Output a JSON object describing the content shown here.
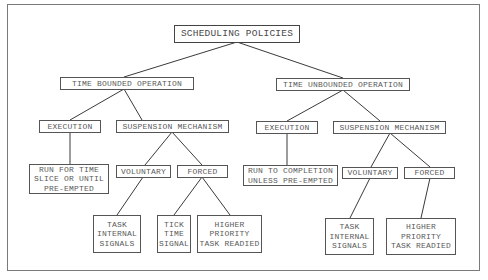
{
  "diagram": {
    "title": "SCHEDULING POLICIES",
    "nodes": {
      "root": {
        "label": "SCHEDULING POLICIES"
      },
      "tb": {
        "label": "TIME BOUNDED OPERATION"
      },
      "tu": {
        "label": "TIME UNBOUNDED OPERATION"
      },
      "tb_exec": {
        "label": "EXECUTION"
      },
      "tb_susp": {
        "label": "SUSPENSION MECHANISM"
      },
      "tu_exec": {
        "label": "EXECUTION"
      },
      "tu_susp": {
        "label": "SUSPENSION MECHANISM"
      },
      "tb_exec_desc": {
        "lines": [
          "RUN FOR TIME",
          "SLICE OR UNTIL",
          "PRE-EMPTED"
        ]
      },
      "tb_vol": {
        "label": "VOLUNTARY"
      },
      "tb_forced": {
        "label": "FORCED"
      },
      "tu_exec_desc": {
        "lines": [
          "RUN TO COMPLETION",
          "UNLESS PRE-EMPTED"
        ]
      },
      "tu_vol": {
        "label": "VOLUNTARY"
      },
      "tu_forced": {
        "label": "FORCED"
      },
      "tb_vol_task": {
        "lines": [
          "TASK",
          "INTERNAL",
          "SIGNALS"
        ]
      },
      "tb_forced_tick": {
        "lines": [
          "TICK",
          "TIME",
          "SIGNAL"
        ]
      },
      "tb_forced_higher": {
        "lines": [
          "HIGHER",
          "PRIORITY",
          "TASK READIED"
        ]
      },
      "tu_vol_task": {
        "lines": [
          "TASK",
          "INTERNAL",
          "SIGNALS"
        ]
      },
      "tu_forced_higher": {
        "lines": [
          "HIGHER",
          "PRIORITY",
          "TASK READIED"
        ]
      }
    },
    "edges": [
      [
        "root",
        "tb"
      ],
      [
        "root",
        "tu"
      ],
      [
        "tb",
        "tb_exec"
      ],
      [
        "tb",
        "tb_susp"
      ],
      [
        "tu",
        "tu_exec"
      ],
      [
        "tu",
        "tu_susp"
      ],
      [
        "tb_exec",
        "tb_exec_desc"
      ],
      [
        "tb_susp",
        "tb_vol"
      ],
      [
        "tb_susp",
        "tb_forced"
      ],
      [
        "tu_exec",
        "tu_exec_desc"
      ],
      [
        "tu_susp",
        "tu_vol"
      ],
      [
        "tu_susp",
        "tu_forced"
      ],
      [
        "tb_vol",
        "tb_vol_task"
      ],
      [
        "tb_forced",
        "tb_forced_tick"
      ],
      [
        "tb_forced",
        "tb_forced_higher"
      ],
      [
        "tu_vol",
        "tu_vol_task"
      ],
      [
        "tu_forced",
        "tu_forced_higher"
      ]
    ]
  }
}
